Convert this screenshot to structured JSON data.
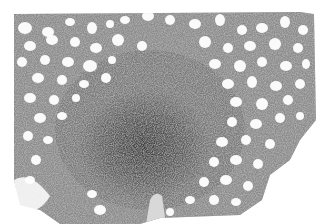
{
  "image": {
    "description": "Grayscale histology micrograph showing dense cellular tissue with numerous round clear vacuoles (fat cells), a dark dense central region, and white background at bottom-left and right edges",
    "tones": {
      "background": "#ffffff",
      "tissue_light": "#9a9a9a",
      "tissue_mid": "#6e6e6e",
      "tissue_dark": "#4a4a4a",
      "vacuole": "#fbfbfb",
      "vessel": "#d9d9d9"
    }
  }
}
